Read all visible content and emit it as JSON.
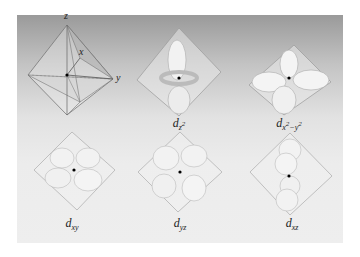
{
  "figure": {
    "axes_panel": {
      "axes": [
        "z",
        "x",
        "y"
      ]
    },
    "orbitals": [
      {
        "id": "dz2",
        "main": "d",
        "sub": "z",
        "sup": "2"
      },
      {
        "id": "dx2-y2",
        "main": "d",
        "sub": "x",
        "sup": "2",
        "sub2": "−y",
        "sup2": "2"
      },
      {
        "id": "dxy",
        "main": "d",
        "sub": "xy"
      },
      {
        "id": "dyz",
        "main": "d",
        "sub": "yz"
      },
      {
        "id": "dxz",
        "main": "d",
        "sub": "xz"
      }
    ],
    "colors": {
      "panel_top": "#9a9a9a",
      "panel_bottom": "#eeeeee",
      "lobe": "#f4f4f4",
      "edge": "#8a8a8a"
    }
  }
}
